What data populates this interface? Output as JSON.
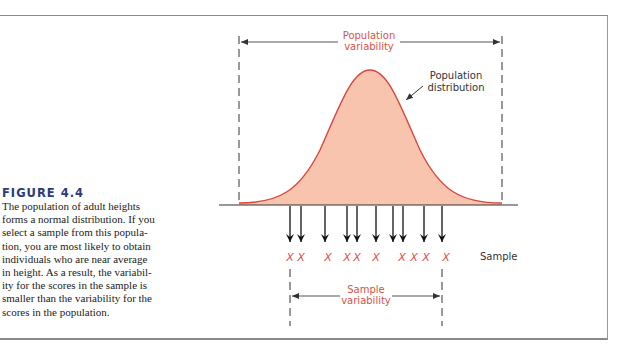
{
  "figure": {
    "title": "FIGURE 4.4",
    "caption": "The population of adult heights forms a normal distribution. If you select a sample from this population, you are most likely to obtain individuals who are near average in height. As a result, the variability for the scores in the sample is smaller than the variability for the scores in the population.",
    "caption_lines": [
      "The population of adult heights",
      "forms a normal distribution. If you",
      "select a sample from this popula-",
      "tion, you are most likely to obtain",
      "individuals who are near average",
      "in height. As a result, the variabil-",
      "ity for the scores in the sample is",
      "smaller than the variability for the",
      "scores in the population."
    ]
  },
  "diagram": {
    "population_variability_label": [
      "Population",
      "variability"
    ],
    "population_distribution_label": [
      "Population",
      "distribution"
    ],
    "sample_label": "Sample",
    "sample_variability_label": [
      "Sample",
      "variability"
    ],
    "sample_marker": "X",
    "sample_count": 10,
    "colors": {
      "curve_fill": "#f9c4ae",
      "curve_stroke": "#d9463c",
      "accent_text": "#d9534a",
      "title": "#2e3a7a",
      "line": "#222222"
    }
  }
}
